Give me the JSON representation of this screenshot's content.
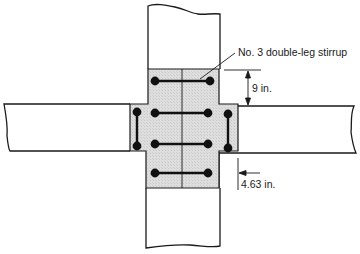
{
  "diagram": {
    "type": "beam-column joint reinforcement detail",
    "colors": {
      "line": "#1a1a1a",
      "joint_fill": "#dcdcdc",
      "background": "#ffffff",
      "bar": "#111111"
    },
    "annotations": {
      "stirrup_label": "No. 3 double-leg stirrup",
      "vertical_dimension": "9 in.",
      "horizontal_dimension": "4.63 in."
    },
    "elements": {
      "column_top": "upper column",
      "column_bottom": "lower column",
      "beam_left": "left beam",
      "beam_right": "right beam",
      "joint": "joint core (shaded)",
      "horizontal_stirrups_count": 4,
      "vertical_ties_count": 2
    }
  }
}
